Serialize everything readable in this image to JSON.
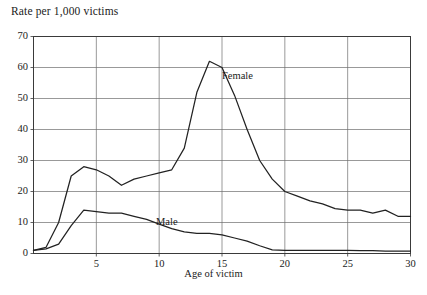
{
  "chart_data": {
    "type": "line",
    "title": "",
    "ylabel": "Rate per 1,000 victims",
    "xlabel": "Age of victim",
    "xlim": [
      0,
      30
    ],
    "ylim": [
      0,
      70
    ],
    "grid": true,
    "legend_position": "inline-annotation",
    "x_ticks": [
      "5",
      "10",
      "15",
      "20",
      "25",
      "30"
    ],
    "x_tick_values": [
      5,
      10,
      15,
      20,
      25,
      30
    ],
    "y_ticks": [
      "0",
      "10",
      "20",
      "30",
      "40",
      "50",
      "60",
      "70"
    ],
    "y_tick_values": [
      0,
      10,
      20,
      30,
      40,
      50,
      60,
      70
    ],
    "x": [
      0,
      1,
      2,
      3,
      4,
      5,
      6,
      7,
      8,
      9,
      10,
      11,
      12,
      13,
      14,
      15,
      16,
      17,
      18,
      19,
      20,
      21,
      22,
      23,
      24,
      25,
      26,
      27,
      28,
      29,
      30
    ],
    "series": [
      {
        "name": "Female",
        "annotation": "Female",
        "color": "#222222",
        "values": [
          1,
          2,
          10,
          25,
          28,
          27,
          25,
          22,
          24,
          25,
          26,
          27,
          34,
          52,
          62,
          60,
          51,
          40,
          30,
          24,
          20,
          18.5,
          17,
          16,
          14.5,
          14,
          14,
          13,
          14,
          12,
          12
        ]
      },
      {
        "name": "Male",
        "annotation": "Male",
        "color": "#222222",
        "values": [
          1,
          1.5,
          3,
          9,
          14,
          13.5,
          13,
          13,
          12,
          11,
          9.5,
          8,
          7,
          6.5,
          6.5,
          6,
          5,
          4,
          2.5,
          1.2,
          1,
          1,
          1,
          1,
          1,
          1,
          0.9,
          0.9,
          0.8,
          0.8,
          0.8
        ]
      }
    ]
  },
  "axis_colors": {
    "frame": "#3a3a3a",
    "grid": "#6d6d6d",
    "line": "#222222"
  }
}
